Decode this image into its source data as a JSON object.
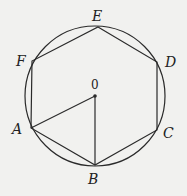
{
  "diagram": {
    "type": "inscribed-hexagon",
    "circle": {
      "cx": 95,
      "cy": 96,
      "r": 70
    },
    "center": {
      "label": "0",
      "x": 95,
      "y": 96,
      "label_x": 91,
      "label_y": 89
    },
    "vertices": [
      {
        "name": "E",
        "x": 98,
        "y": 27,
        "label_x": 92,
        "label_y": 21
      },
      {
        "name": "D",
        "x": 157,
        "y": 62,
        "label_x": 165,
        "label_y": 67
      },
      {
        "name": "C",
        "x": 157,
        "y": 130,
        "label_x": 163,
        "label_y": 135
      },
      {
        "name": "B",
        "x": 95,
        "y": 165,
        "label_x": 88,
        "label_y": 183
      },
      {
        "name": "A",
        "x": 31,
        "y": 128,
        "label_x": 12,
        "label_y": 133
      },
      {
        "name": "F",
        "x": 32,
        "y": 61,
        "label_x": 16,
        "label_y": 66
      }
    ],
    "segments": [
      [
        "E",
        "D"
      ],
      [
        "D",
        "C"
      ],
      [
        "C",
        "B"
      ],
      [
        "B",
        "A"
      ],
      [
        "A",
        "F"
      ],
      [
        "F",
        "E"
      ],
      [
        "O",
        "A"
      ],
      [
        "O",
        "B"
      ]
    ],
    "colors": {
      "stroke": "#2a2a2a",
      "background": "#f1f1ef"
    }
  }
}
